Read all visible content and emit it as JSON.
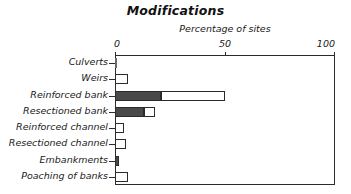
{
  "chart_data": {
    "type": "bar",
    "orientation": "horizontal",
    "stacked": true,
    "title": "Modifications",
    "xlabel": "Percentage of sites",
    "ylabel": "",
    "xlim": [
      0,
      100
    ],
    "xticks": [
      0,
      50,
      100
    ],
    "xticklabels": [
      "0",
      "50",
      "100"
    ],
    "grid": false,
    "legend": "none",
    "categories": [
      "Culverts",
      "Weirs",
      "Reinforced bank",
      "Resectioned bank",
      "Reinforced channel",
      "Resectioned channel",
      "Embankments",
      "Poaching of banks"
    ],
    "series": [
      {
        "name": "Extensive",
        "style": "dark-filled",
        "color": "#4a4a4a",
        "values": [
          0.5,
          0,
          21,
          13,
          0,
          0,
          2,
          0
        ]
      },
      {
        "name": "Present",
        "style": "open-outline",
        "color": "#ffffff",
        "values": [
          0,
          6,
          29,
          5,
          4,
          5,
          0,
          6
        ]
      }
    ],
    "totals": [
      0.5,
      6,
      50,
      18,
      4,
      5,
      2,
      6
    ]
  },
  "axis": {
    "ticks": [
      {
        "label": "0",
        "value": 0
      },
      {
        "label": "50",
        "value": 50
      },
      {
        "label": "100",
        "value": 100
      }
    ]
  },
  "colors": {
    "dark_fill": "#4a4a4a",
    "outline": "#2b2b2b",
    "open_fill": "#ffffff",
    "text": "#1a1a1a",
    "background": "#ffffff"
  }
}
